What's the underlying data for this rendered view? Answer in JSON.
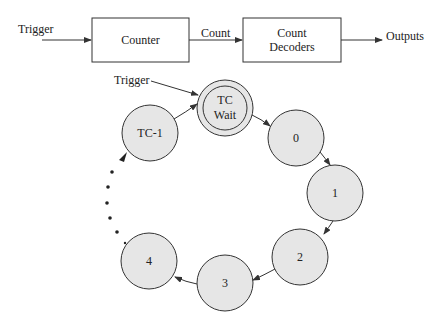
{
  "block_diagram": {
    "input_label": "Trigger",
    "counter_label": "Counter",
    "link_label": "Count",
    "decoder_label_line1": "Count",
    "decoder_label_line2": "Decoders",
    "output_label": "Outputs"
  },
  "state_diagram": {
    "trigger_label": "Trigger",
    "states": [
      {
        "id": "tc-wait",
        "line1": "TC",
        "line2": "Wait",
        "double": true
      },
      {
        "id": "s0",
        "label": "0"
      },
      {
        "id": "s1",
        "label": "1"
      },
      {
        "id": "s2",
        "label": "2"
      },
      {
        "id": "s3",
        "label": "3"
      },
      {
        "id": "s4",
        "label": "4"
      },
      {
        "id": "tc-1",
        "label": "TC-1"
      }
    ]
  },
  "colors": {
    "stroke": "#333333",
    "state_fill": "#e6e6e6",
    "background": "#ffffff"
  }
}
